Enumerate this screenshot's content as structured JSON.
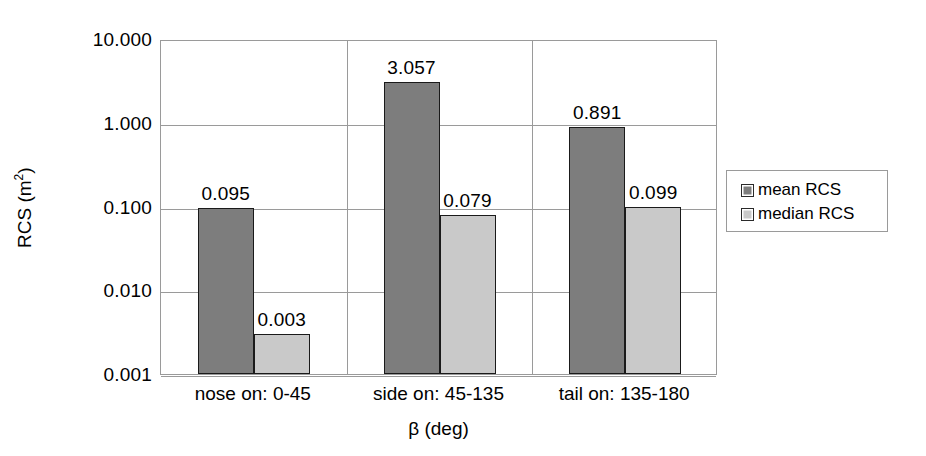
{
  "chart_data": {
    "type": "bar",
    "title": "",
    "xlabel": "β (deg)",
    "ylabel": "RCS (m²)",
    "ylabel_base": "RCS (m",
    "ylabel_sup": "2",
    "ylabel_close": ")",
    "yscale": "log",
    "ylim": [
      0.001,
      10.0
    ],
    "grid": true,
    "legend_position": "right",
    "categories": [
      "nose on:  0-45",
      "side on: 45-135",
      "tail on: 135-180"
    ],
    "ytick_labels": [
      "10.000",
      "1.000",
      "0.100",
      "0.010",
      "0.001"
    ],
    "ytick_values": [
      10.0,
      1.0,
      0.1,
      0.01,
      0.001
    ],
    "series": [
      {
        "name": "mean RCS",
        "color": "#7d7d7d",
        "values": [
          0.095,
          3.057,
          0.891
        ],
        "labels": [
          "0.095",
          "3.057",
          "0.891"
        ]
      },
      {
        "name": "median RCS",
        "color": "#c9c9c9",
        "values": [
          0.003,
          0.079,
          0.099
        ],
        "labels": [
          "0.003",
          "0.079",
          "0.099"
        ]
      }
    ]
  },
  "legend": {
    "items": [
      {
        "label": "mean RCS",
        "swatch": "mean"
      },
      {
        "label": "median RCS",
        "swatch": "median"
      }
    ]
  },
  "colors": {
    "mean": "#7d7d7d",
    "median": "#c9c9c9",
    "bar_outline": "#1a1a1a",
    "grid": "#9a9a9a",
    "background": "#ffffff",
    "text": "#000000"
  }
}
